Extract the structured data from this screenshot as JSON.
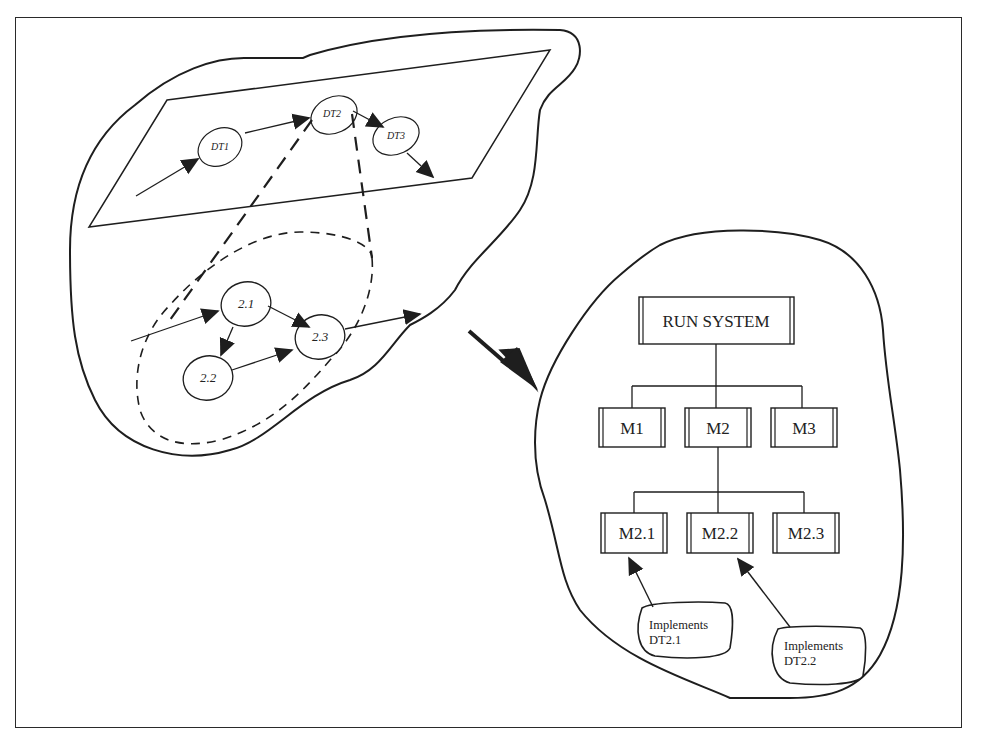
{
  "diagram": {
    "left_region": {
      "top_plane": {
        "nodes": [
          {
            "id": "DT1",
            "label": "DT1"
          },
          {
            "id": "DT2",
            "label": "DT2"
          },
          {
            "id": "DT3",
            "label": "DT3"
          }
        ]
      },
      "decomposition": {
        "nodes": [
          {
            "id": "2.1",
            "label": "2.1"
          },
          {
            "id": "2.2",
            "label": "2.2"
          },
          {
            "id": "2.3",
            "label": "2.3"
          }
        ]
      }
    },
    "right_region": {
      "root": {
        "label": "RUN SYSTEM"
      },
      "level1": [
        {
          "label": "M1"
        },
        {
          "label": "M2"
        },
        {
          "label": "M3"
        }
      ],
      "level2": [
        {
          "label": "M2.1"
        },
        {
          "label": "M2.2"
        },
        {
          "label": "M2.3"
        }
      ],
      "notes": [
        {
          "line1": "Implements",
          "line2": "DT2.1",
          "target": "M2.1"
        },
        {
          "line1": "Implements",
          "line2": "DT2.2",
          "target": "M2.2"
        }
      ]
    },
    "colors": {
      "stroke": "#1e1e1e",
      "background": "#ffffff"
    }
  }
}
